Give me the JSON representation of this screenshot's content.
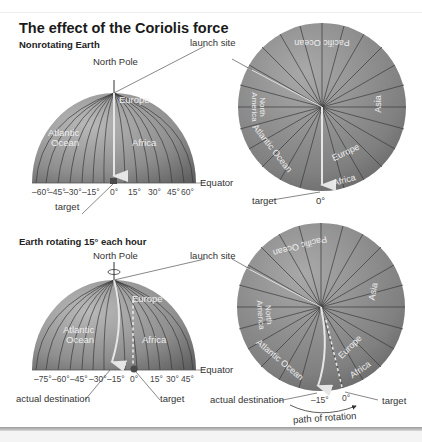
{
  "title": "The effect of the Coriolis force",
  "panels": {
    "nonrotating": {
      "subtitle": "Nonrotating Earth",
      "side_view": {
        "north_pole": "North Pole",
        "launch_site": "launch site",
        "equator": "Equator",
        "target": "target",
        "regions": [
          "Europe",
          "Atlantic",
          "Ocean",
          "Africa"
        ],
        "longitudes": [
          "–60°",
          "–45°",
          "–30°",
          "–15°",
          "0°",
          "15°",
          "30°",
          "45°",
          "60°"
        ]
      },
      "top_view": {
        "regions": [
          "Pacific Ocean",
          "North",
          "America",
          "Asia",
          "Atlantic Ocean",
          "Europe",
          "Africa"
        ],
        "target": "target",
        "zero": "0°"
      }
    },
    "rotating": {
      "subtitle": "Earth rotating 15° each hour",
      "side_view": {
        "north_pole": "North Pole",
        "launch_site": "launch site",
        "equator": "Equator",
        "actual_destination": "actual destination",
        "target": "target",
        "regions": [
          "Europe",
          "Atlantic",
          "Ocean",
          "Africa"
        ],
        "longitudes": [
          "–75°",
          "–60°",
          "–45°",
          "–30°",
          "–15°",
          "0°",
          "15°",
          "30°",
          "45°"
        ]
      },
      "top_view": {
        "regions": [
          "Pacific Ocean",
          "North",
          "America",
          "Asia",
          "Atlantic Ocean",
          "Europe",
          "Africa"
        ],
        "actual_destination": "actual destination",
        "target": "target",
        "minus15": "–15°",
        "zero": "0°",
        "path_of_rotation": "path of rotation"
      }
    }
  },
  "colors": {
    "globe_light": "#a8a8a8",
    "globe_dark": "#6e6e6e",
    "meridian": "#3a3a3a",
    "arrow": "#e6e6e6",
    "text": "#333333"
  }
}
